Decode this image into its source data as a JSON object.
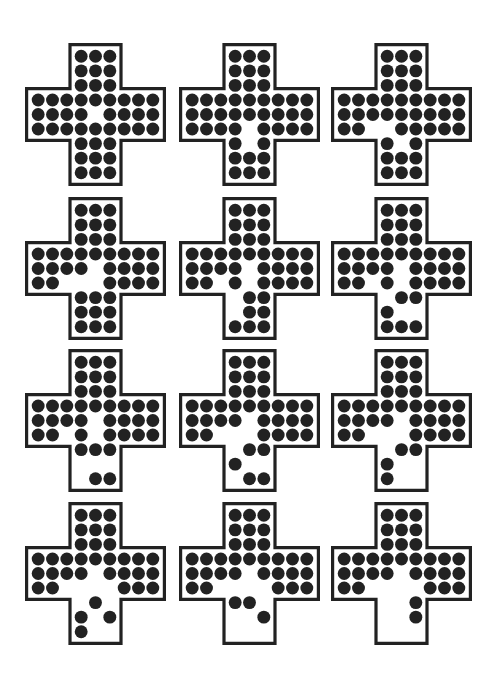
{
  "diagram": {
    "title": "",
    "colors": {
      "peg": "#222222",
      "board_outline": "#222222",
      "background": "#ffffff"
    },
    "legend": {
      "X": "peg",
      "_": "empty hole",
      " ": "off-board"
    },
    "boards": [
      {
        "id": 1,
        "rows": [
          "   XXX   ",
          "   XXX   ",
          "   XXX   ",
          "XXXXXXXXX",
          "XXXX_XXXX",
          "XXXXXXXXX",
          "   XXX   ",
          "   XXX   ",
          "   XXX   "
        ]
      },
      {
        "id": 2,
        "rows": [
          "   XXX   ",
          "   XXX   ",
          "   XXX   ",
          "XXXXXXXXX",
          "XXXXXXXXX",
          "XXXX_XXXX",
          "   X_X   ",
          "   XXX   ",
          "   XXX   "
        ]
      },
      {
        "id": 3,
        "rows": [
          "   XXX   ",
          "   XXX   ",
          "   XXX   ",
          "XXXXXXXXX",
          "XXXXXXXXX",
          "XX__XXXXX",
          "   X_X   ",
          "   XXX   ",
          "   XXX   "
        ]
      },
      {
        "id": 4,
        "rows": [
          "   XXX   ",
          "   XXX   ",
          "   XXX   ",
          "XXXXXXXXX",
          "XXXX_XXXX",
          "XX___XXXX",
          "   XXX   ",
          "   XXX   ",
          "   XXX   "
        ]
      },
      {
        "id": 5,
        "rows": [
          "   XXX   ",
          "   XXX   ",
          "   XXX   ",
          "XXXXXXXXX",
          "XXXX_XXXX",
          "XX_X_XXXX",
          "   _XX   ",
          "   _XX   ",
          "   XXX   "
        ]
      },
      {
        "id": 6,
        "rows": [
          "   XXX   ",
          "   XXX   ",
          "   XXX   ",
          "XXXXXXXXX",
          "XXXX_XXXX",
          "XX_X_XXXX",
          "   _XX   ",
          "   X__   ",
          "   XXX   "
        ]
      },
      {
        "id": 7,
        "rows": [
          "   XXX   ",
          "   XXX   ",
          "   XXX   ",
          "XXXXXXXXX",
          "XXXX_XXXX",
          "XX_X_XXXX",
          "   XXX   ",
          "   ___   ",
          "   _XX   "
        ]
      },
      {
        "id": 8,
        "rows": [
          "   XXX   ",
          "   XXX   ",
          "   XXX   ",
          "XXXXXXXXX",
          "XXXX_XXXX",
          "XX___XXXX",
          "   _XX   ",
          "   X__   ",
          "   _XX   "
        ]
      },
      {
        "id": 9,
        "rows": [
          "   XXX   ",
          "   XXX   ",
          "   XXX   ",
          "XXXXXXXXX",
          "XXXX_XXXX",
          "XX___XXXX",
          "   _XX   ",
          "   X__   ",
          "   X__   "
        ]
      },
      {
        "id": 10,
        "rows": [
          "   XXX   ",
          "   XXX   ",
          "   XXX   ",
          "XXXXXXXXX",
          "XXXX_XXXX",
          "XX____XXX",
          "   _X_   ",
          "   X_X   ",
          "   X__   "
        ]
      },
      {
        "id": 11,
        "rows": [
          "   XXX   ",
          "   XXX   ",
          "   XXX   ",
          "XXXXXXXXX",
          "XXXX_XXXX",
          "XX____XXX",
          "   XX_   ",
          "   __X   ",
          "   ___   "
        ]
      },
      {
        "id": 12,
        "rows": [
          "   XXX   ",
          "   XXX   ",
          "   XXX   ",
          "XXXXXXXXX",
          "XXXX_XXXX",
          "XX____XXX",
          "   __X   ",
          "   __X   ",
          "   ___   "
        ]
      }
    ],
    "layout": {
      "columns_x": [
        25,
        179,
        331
      ],
      "rows_y": [
        43,
        197,
        349,
        502
      ]
    }
  }
}
